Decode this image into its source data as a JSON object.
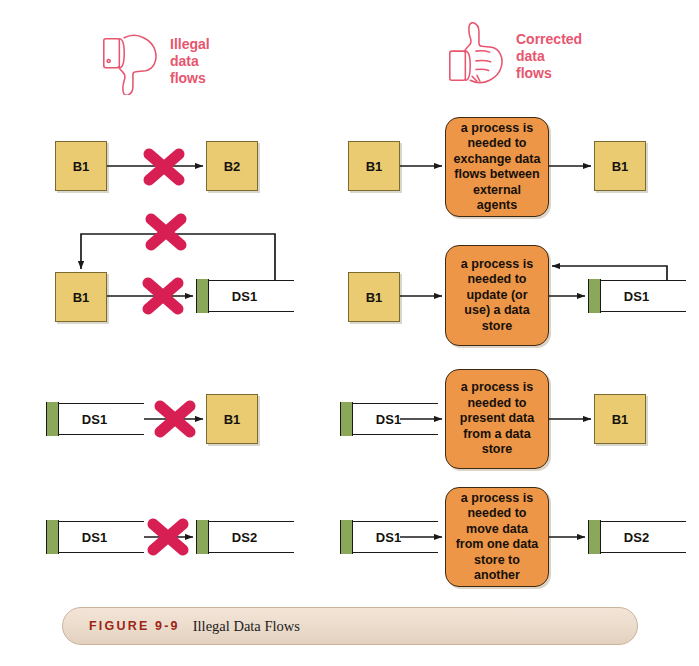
{
  "figure": {
    "number": "FIGURE 9-9",
    "title": "Illegal Data Flows"
  },
  "headers": {
    "left": {
      "icon": "thumbs-down-icon",
      "text": "Illegal\ndata\nflows",
      "color": "#e8556f"
    },
    "right": {
      "icon": "thumbs-up-icon",
      "text": "Corrected\ndata\nflows",
      "color": "#e8556f"
    }
  },
  "palette": {
    "external_agent_fill": "#ebcb72",
    "external_agent_border": "#7a6a32",
    "process_fill": "#ed9647",
    "process_border": "#3b2a14",
    "datastore_tab": "#8ba85a",
    "datastore_fill": "#ffffff",
    "x_mark": "#d81f54",
    "connector": "#1a1a1a",
    "caption_number": "#9e2418",
    "caption_bar": "#eadbcb"
  },
  "rows": [
    {
      "id": "row-1",
      "illegal": {
        "source": "B1",
        "source_type": "external-agent",
        "target": "B2",
        "target_type": "external-agent",
        "blocked": true
      },
      "corrected": {
        "source": "B1",
        "source_type": "external-agent",
        "process": "a process is needed to exchange data flows between external agents",
        "target": "B1",
        "target_type": "external-agent",
        "feedback": false
      }
    },
    {
      "id": "row-2",
      "illegal": {
        "source": "B1",
        "source_type": "external-agent",
        "target": "DS1",
        "target_type": "data-store",
        "blocked": true,
        "feedback": true,
        "feedback_blocked": true
      },
      "corrected": {
        "source": "B1",
        "source_type": "external-agent",
        "process": "a process is needed to update (or use) a data store",
        "target": "DS1",
        "target_type": "data-store",
        "feedback": true
      }
    },
    {
      "id": "row-3",
      "illegal": {
        "source": "DS1",
        "source_type": "data-store",
        "target": "B1",
        "target_type": "external-agent",
        "blocked": true
      },
      "corrected": {
        "source": "DS1",
        "source_type": "data-store",
        "process": "a process is needed to present data from a data store",
        "target": "B1",
        "target_type": "external-agent",
        "feedback": false
      }
    },
    {
      "id": "row-4",
      "illegal": {
        "source": "DS1",
        "source_type": "data-store",
        "target": "DS2",
        "target_type": "data-store",
        "blocked": true
      },
      "corrected": {
        "source": "DS1",
        "source_type": "data-store",
        "process": "a process is needed to move data from one data store to another",
        "target": "DS2",
        "target_type": "data-store",
        "feedback": false
      }
    }
  ]
}
